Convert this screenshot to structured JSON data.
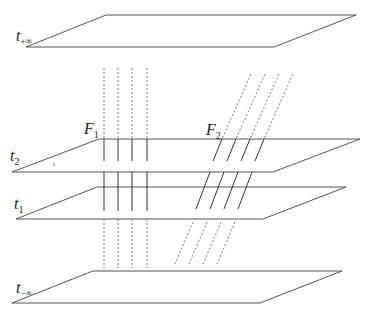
{
  "labels": {
    "t_plus_inf": {
      "main": "t",
      "sub": "+∞"
    },
    "t2": {
      "main": "t",
      "sub": "2"
    },
    "t1": {
      "main": "t",
      "sub": "1"
    },
    "t_minus_inf": {
      "main": "t",
      "sub": "−∞"
    },
    "F1": {
      "main": "F",
      "sub": "1"
    },
    "F2": {
      "main": "F",
      "sub": "2"
    }
  },
  "colors": {
    "line": "#333333",
    "dashed": "#777777",
    "background": "#ffffff"
  }
}
